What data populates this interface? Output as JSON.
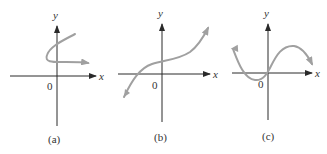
{
  "figure": {
    "panels": [
      {
        "id": "a",
        "caption": "(a)",
        "x_label": "x",
        "y_label": "y",
        "origin_label": "0",
        "curve_description": "curve that fails vertical line test (sideways S shape)"
      },
      {
        "id": "b",
        "caption": "(b)",
        "x_label": "x",
        "y_label": "y",
        "origin_label": "0",
        "curve_description": "increasing cubic-like curve"
      },
      {
        "id": "c",
        "caption": "(c)",
        "x_label": "x",
        "y_label": "y",
        "origin_label": "0",
        "curve_description": "wavy cubic curve with local min and max"
      }
    ],
    "colors": {
      "axis": "#2a2a2a",
      "curve": "#a0a0a0",
      "background": "#ffffff"
    }
  }
}
